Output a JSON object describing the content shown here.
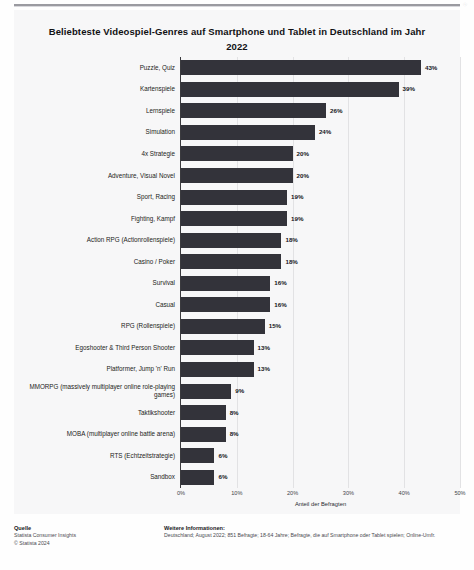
{
  "document": {
    "corner_mark": "ⓘ"
  },
  "chart_data": {
    "type": "bar",
    "orientation": "horizontal",
    "title": "Beliebteste Videospiel-Genres auf Smartphone und Tablet in Deutschland im Jahr 2022",
    "xlabel": "Anteil der Befragten",
    "ylabel": "",
    "xlim": [
      0,
      50
    ],
    "xticks": [
      0,
      10,
      20,
      30,
      40,
      50
    ],
    "xtick_labels": [
      "0%",
      "10%",
      "20%",
      "30%",
      "40%",
      "50%"
    ],
    "grid": true,
    "legend": null,
    "bar_color": "#33333a",
    "value_suffix": "%",
    "categories": [
      "Puzzle, Quiz",
      "Kartenspiele",
      "Lernspiele",
      "Simulation",
      "4x Strategie",
      "Adventure, Visual Novel",
      "Sport, Racing",
      "Fighting, Kampf",
      "Action RPG (Actionrollenspiele)",
      "Casino / Poker",
      "Survival",
      "Casual",
      "RPG (Rollenspiele)",
      "Egoshooter & Third Person Shooter",
      "Platformer, Jump 'n' Run",
      "MMORPG (massively multiplayer online role-playing games)",
      "Taktikshooter",
      "MOBA (multiplayer online battle arena)",
      "RTS (Echtzeitstrategie)",
      "Sandbox"
    ],
    "values": [
      43,
      39,
      26,
      24,
      20,
      20,
      19,
      19,
      18,
      18,
      16,
      16,
      15,
      13,
      13,
      9,
      8,
      8,
      6,
      6
    ],
    "value_labels": [
      "43%",
      "39%",
      "26%",
      "24%",
      "20%",
      "20%",
      "19%",
      "19%",
      "18%",
      "18%",
      "16%",
      "16%",
      "15%",
      "13%",
      "13%",
      "9%",
      "8%",
      "8%",
      "6%",
      "6%"
    ]
  },
  "footer": {
    "source_heading": "Quelle",
    "source_lines": [
      "Statista Consumer Insights",
      "© Statista 2024"
    ],
    "info_heading": "Weitere Informationen:",
    "info_lines": [
      "Deutschland; August 2022; 851 Befragte; 18-64 Jahre; Befragte, die auf Smartphone oder Tablet spielen; Online-Umfr."
    ]
  }
}
